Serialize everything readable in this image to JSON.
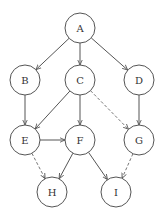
{
  "diagram": {
    "type": "directed-graph",
    "colors": {
      "stroke": "#555555",
      "dashed": "#777777",
      "text": "#333333",
      "background": "#ffffff"
    },
    "node_radius": 15,
    "nodes": [
      {
        "id": "A",
        "label": "A",
        "x": 80,
        "y": 28
      },
      {
        "id": "B",
        "label": "B",
        "x": 25,
        "y": 80
      },
      {
        "id": "C",
        "label": "C",
        "x": 80,
        "y": 80
      },
      {
        "id": "D",
        "label": "D",
        "x": 139,
        "y": 80
      },
      {
        "id": "E",
        "label": "E",
        "x": 25,
        "y": 140
      },
      {
        "id": "F",
        "label": "F",
        "x": 80,
        "y": 140
      },
      {
        "id": "G",
        "label": "G",
        "x": 139,
        "y": 140
      },
      {
        "id": "H",
        "label": "H",
        "x": 52,
        "y": 192
      },
      {
        "id": "I",
        "label": "I",
        "x": 116,
        "y": 192
      }
    ],
    "edges": [
      {
        "from": "A",
        "to": "B",
        "style": "solid"
      },
      {
        "from": "A",
        "to": "C",
        "style": "solid"
      },
      {
        "from": "A",
        "to": "D",
        "style": "solid"
      },
      {
        "from": "B",
        "to": "E",
        "style": "solid"
      },
      {
        "from": "C",
        "to": "E",
        "style": "solid"
      },
      {
        "from": "C",
        "to": "F",
        "style": "solid"
      },
      {
        "from": "C",
        "to": "G",
        "style": "dashed"
      },
      {
        "from": "D",
        "to": "G",
        "style": "solid"
      },
      {
        "from": "E",
        "to": "F",
        "style": "solid"
      },
      {
        "from": "E",
        "to": "H",
        "style": "dashed"
      },
      {
        "from": "F",
        "to": "H",
        "style": "solid"
      },
      {
        "from": "F",
        "to": "I",
        "style": "solid"
      },
      {
        "from": "G",
        "to": "I",
        "style": "dashed"
      }
    ]
  }
}
